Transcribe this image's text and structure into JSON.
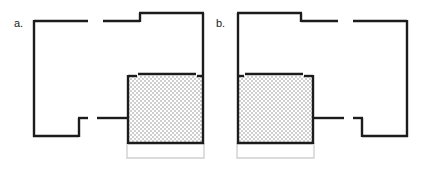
{
  "figure": {
    "background_color": "#ffffff",
    "wall_color": "#1c1c1c",
    "shade_fill_color": "#d9d9d9",
    "light_outline_color": "#d0d0d0",
    "panels": [
      {
        "id": "panel-a",
        "label": "a.",
        "label_x": 14,
        "label_y": 27,
        "mirrored": false,
        "description": "floor-plan-left"
      },
      {
        "id": "panel-b",
        "label": "b.",
        "label_x": 216,
        "label_y": 27,
        "mirrored": true,
        "description": "floor-plan-right"
      }
    ]
  }
}
